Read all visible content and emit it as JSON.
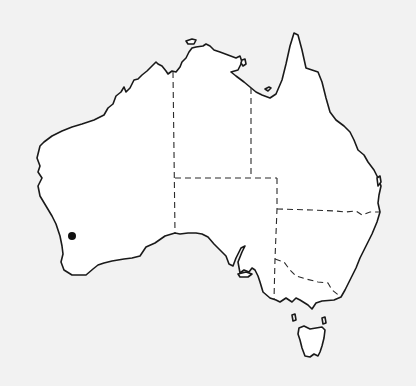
{
  "map": {
    "subject": "Australia outline map",
    "background_color": "#f2f2f2",
    "land_color": "#ffffff",
    "outline_color": "#1a1a1a",
    "borders_style": "dashed",
    "states": [
      "Western Australia",
      "Northern Territory",
      "South Australia",
      "Queensland",
      "New South Wales",
      "Victoria",
      "Tasmania"
    ],
    "marker": {
      "shape": "filled-circle",
      "color": "#111111",
      "x": 72,
      "y": 236,
      "radius": 4,
      "region": "south-west Western Australia"
    }
  }
}
